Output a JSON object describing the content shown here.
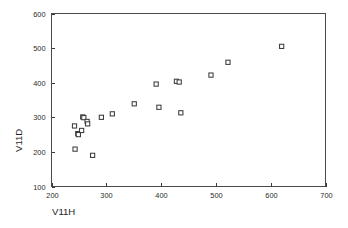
{
  "chart_data": {
    "type": "scatter",
    "title": "",
    "xlabel": "V11H",
    "ylabel": "V11D",
    "xlim": [
      200,
      700
    ],
    "ylim": [
      100,
      600
    ],
    "xticks": [
      200,
      300,
      400,
      500,
      600,
      700
    ],
    "yticks": [
      100,
      200,
      300,
      400,
      500,
      600
    ],
    "xtick_labels": [
      "200",
      "300",
      "400",
      "500",
      "600",
      "700"
    ],
    "ytick_labels": [
      "100",
      "200",
      "300",
      "400",
      "500",
      "600"
    ],
    "grid": false,
    "legend": false,
    "marker": "open-square",
    "marker_color": "#3c3c3c",
    "frame_color": "#4a4a4a",
    "points": [
      {
        "x": 242,
        "y": 275
      },
      {
        "x": 243,
        "y": 208
      },
      {
        "x": 248,
        "y": 253
      },
      {
        "x": 249,
        "y": 250
      },
      {
        "x": 255,
        "y": 262
      },
      {
        "x": 257,
        "y": 301
      },
      {
        "x": 259,
        "y": 299
      },
      {
        "x": 265,
        "y": 288
      },
      {
        "x": 266,
        "y": 281
      },
      {
        "x": 275,
        "y": 190
      },
      {
        "x": 291,
        "y": 300
      },
      {
        "x": 311,
        "y": 310
      },
      {
        "x": 351,
        "y": 339
      },
      {
        "x": 391,
        "y": 396
      },
      {
        "x": 396,
        "y": 329
      },
      {
        "x": 428,
        "y": 404
      },
      {
        "x": 433,
        "y": 402
      },
      {
        "x": 436,
        "y": 313
      },
      {
        "x": 491,
        "y": 422
      },
      {
        "x": 522,
        "y": 459
      },
      {
        "x": 620,
        "y": 505
      }
    ]
  }
}
